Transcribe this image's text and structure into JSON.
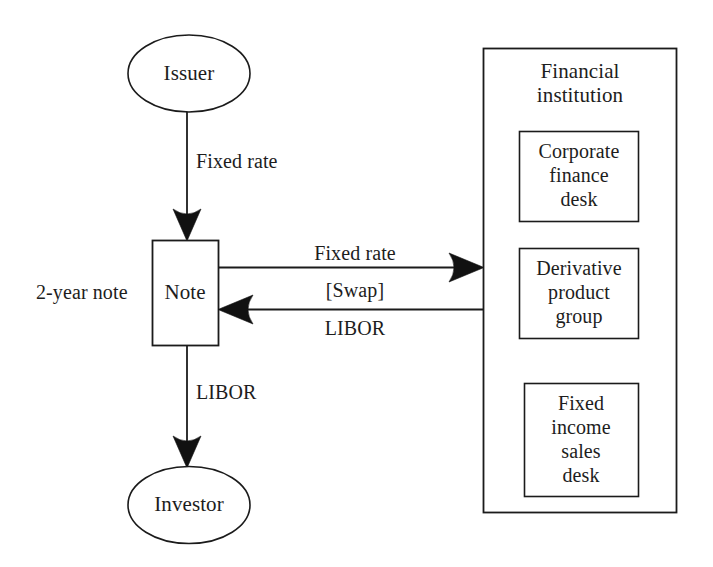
{
  "diagram": {
    "background_color": "#ffffff",
    "stroke_color": "#1b1b1b",
    "nodes": {
      "issuer": {
        "label": "Issuer",
        "shape": "ellipse"
      },
      "note": {
        "label": "Note",
        "shape": "rectangle"
      },
      "investor": {
        "label": "Investor",
        "shape": "ellipse"
      },
      "financial_institution": {
        "label_line1": "Financial",
        "label_line2": "institution",
        "shape": "rectangle",
        "children": [
          {
            "id": "corporate-finance-desk",
            "lines": [
              "Corporate",
              "finance",
              "desk"
            ]
          },
          {
            "id": "derivative-product-group",
            "lines": [
              "Derivative",
              "product",
              "group"
            ]
          },
          {
            "id": "fixed-income-sales-desk",
            "lines": [
              "Fixed",
              "income",
              "sales",
              "desk"
            ]
          }
        ]
      }
    },
    "edges": [
      {
        "id": "issuer-to-note",
        "label": "Fixed rate",
        "direction": "down"
      },
      {
        "id": "note-to-fi-fixed",
        "label": "Fixed rate",
        "direction": "right"
      },
      {
        "id": "fi-to-note-libor",
        "label": "LIBOR",
        "direction": "left"
      },
      {
        "id": "note-to-investor",
        "label": "LIBOR",
        "direction": "down"
      }
    ],
    "annotations": [
      {
        "id": "note-tenor",
        "label": "2-year note"
      },
      {
        "id": "swap-bracket",
        "label": "[Swap]"
      }
    ]
  }
}
